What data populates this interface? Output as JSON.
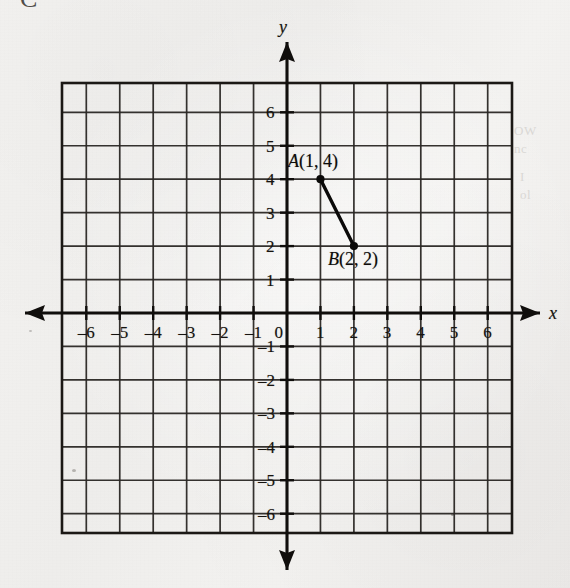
{
  "figure": {
    "kind": "coordinate-plane",
    "axis_x_name": "x",
    "axis_y_name": "y",
    "origin_label": "0"
  },
  "artifacts": {
    "corner_mark": "C",
    "bleed_right_top": "OW\nnc",
    "bleed_right_mid": "I\nol"
  },
  "chart_data": {
    "type": "scatter",
    "title": "",
    "subtitle": "",
    "xlabel": "x",
    "ylabel": "y",
    "xlim": [
      -7,
      7
    ],
    "ylim": [
      -7,
      7
    ],
    "grid": true,
    "grid_step": 1,
    "legend": "none",
    "x_tick_labels": [
      "-6",
      "-5",
      "-4",
      "-3",
      "-2",
      "-1",
      "0",
      "1",
      "2",
      "3",
      "4",
      "5",
      "6"
    ],
    "x_tick_values": [
      -6,
      -5,
      -4,
      -3,
      -2,
      -1,
      0,
      1,
      2,
      3,
      4,
      5,
      6
    ],
    "y_tick_labels": [
      "6",
      "5",
      "4",
      "3",
      "2",
      "1",
      "-1",
      "-2",
      "-3",
      "-4",
      "-5",
      "-6"
    ],
    "y_tick_values": [
      6,
      5,
      4,
      3,
      2,
      1,
      -1,
      -2,
      -3,
      -4,
      -5,
      -6
    ],
    "points": [
      {
        "name": "A",
        "label": "A(1, 4)",
        "letter": "A",
        "coords": "(1, 4)",
        "x": 1,
        "y": 4
      },
      {
        "name": "B",
        "label": "B(2, 2)",
        "letter": "B",
        "coords": "(2, 2)",
        "x": 2,
        "y": 2
      }
    ],
    "segments": [
      {
        "from": "A",
        "to": "B",
        "x1": 1,
        "y1": 4,
        "x2": 2,
        "y2": 2
      }
    ],
    "annotations": [
      {
        "text": "A(1, 4)",
        "x": 1,
        "y": 4
      },
      {
        "text": "B(2, 2)",
        "x": 2,
        "y": 2
      }
    ]
  }
}
